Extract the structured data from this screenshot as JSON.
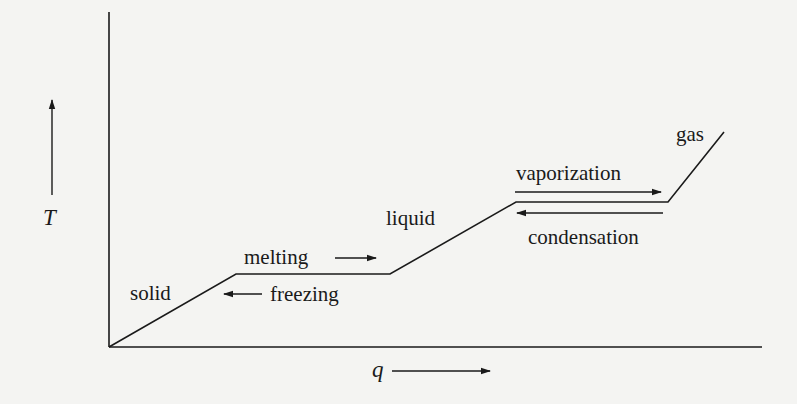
{
  "diagram": {
    "type": "heating-curve",
    "axes": {
      "y_label": "T",
      "x_label": "q"
    },
    "phases": {
      "solid": "solid",
      "liquid": "liquid",
      "gas": "gas"
    },
    "transitions": {
      "melting": "melting",
      "freezing": "freezing",
      "vaporization": "vaporization",
      "condensation": "condensation"
    },
    "colors": {
      "background": "#f4f4f2",
      "ink": "#1a1a1a"
    },
    "curve_points": [
      [
        109,
        347
      ],
      [
        236,
        274
      ],
      [
        390,
        274
      ],
      [
        516,
        202
      ],
      [
        668,
        202
      ],
      [
        724,
        132
      ]
    ]
  }
}
